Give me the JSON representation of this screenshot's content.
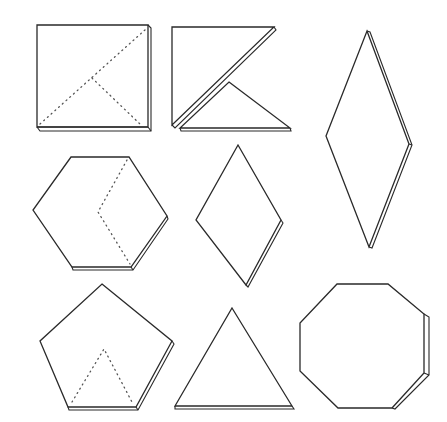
{
  "figure": {
    "description": "Line drawing of flat geometric tiles with thickness shown on one edge",
    "background": "#ffffff",
    "stroke_color": "#2a2a2a",
    "shapes": [
      {
        "id": "square",
        "label": "Square",
        "row": 1,
        "col": 1,
        "fold_lines": "dotted diagonal split into triangles"
      },
      {
        "id": "split-square-triangles",
        "label": "Two right triangles (square halves)",
        "row": 1,
        "col": 2
      },
      {
        "id": "tall-rhombus",
        "label": "Tall rhombus",
        "row": 1,
        "col": 3
      },
      {
        "id": "hexagon",
        "label": "Hexagon",
        "row": 2,
        "col": 1,
        "fold_lines": "dotted chevron"
      },
      {
        "id": "rhombus",
        "label": "Rhombus",
        "row": 2,
        "col": 2
      },
      {
        "id": "pentagon",
        "label": "Pentagon",
        "row": 3,
        "col": 1,
        "fold_lines": "dotted inner triangle"
      },
      {
        "id": "triangle",
        "label": "Equilateral triangle",
        "row": 3,
        "col": 2
      },
      {
        "id": "octagon",
        "label": "Octagon",
        "row": 3,
        "col": 3
      }
    ]
  }
}
